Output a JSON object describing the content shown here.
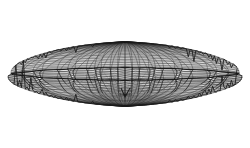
{
  "figure": {
    "title": "",
    "caption": "",
    "kind": "3d-wireframe-surface",
    "background_color": "#ffffff",
    "line_color": "#1a1a1a",
    "shading_color": "#9a9a9a",
    "highlight_color": "#f2f2f2"
  },
  "chart_data": {
    "type": "wireframe-3d",
    "title": "",
    "xlabel": "",
    "ylabel": "",
    "legend": [],
    "grid": false,
    "surface": {
      "name": "pleated-lens-surface",
      "u_divisions": 64,
      "v_divisions": 26,
      "u_range": [
        0,
        6.283185307179586
      ],
      "v_range": [
        -1.5707963267948966,
        1.5707963267948966
      ],
      "radius_x": 1.0,
      "radius_y": 0.52,
      "radius_z": 0.56,
      "pleat_count": 16,
      "pleat_amplitude": 0.045,
      "equator_crease_v": 0.0,
      "cusp_depth": 0.3,
      "cusp_radius": 0.42,
      "tip_sharpness": 1.6
    },
    "projection": {
      "type": "orthographic",
      "elevation_deg": 22,
      "azimuth_deg": 0,
      "roll_deg": 0,
      "center_px": [
        125,
        74
      ],
      "scale_px": 112,
      "vertical_scale": 0.56
    },
    "bounds_px": {
      "left": 14,
      "right": 237,
      "top": 14,
      "bottom": 129,
      "width": 223,
      "height": 115
    },
    "features": [
      {
        "name": "upper-dome",
        "description": "convex upper cap of the lens with rhombic mesh"
      },
      {
        "name": "equatorial-crease",
        "description": "dark fold line running left tip to right tip"
      },
      {
        "name": "pleated-skirt",
        "description": "band of bright rounded cells just under the crease"
      },
      {
        "name": "lower-bowl",
        "description": "concave-looking underside mesh seen from outside"
      },
      {
        "name": "central-cusp",
        "description": "downward pinch point near image center"
      },
      {
        "name": "left-tip",
        "description": "sharp point at the left extremity"
      },
      {
        "name": "right-tip",
        "description": "sharp point at the right extremity"
      }
    ],
    "rendered_line_widths": {
      "upper_dome": 0.45,
      "lower_bowl": 0.45,
      "crease": 1.1,
      "pleat": 0.55,
      "silhouette": 0.9
    }
  }
}
